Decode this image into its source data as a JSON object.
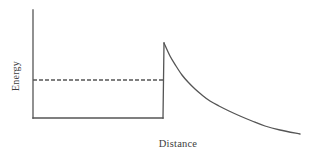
{
  "figure": {
    "background_color": "#ffffff",
    "stroke_color": "#555555",
    "text_color": "#3d3d3d"
  },
  "labels": {
    "ylabel": "Energy",
    "xlabel": "Distance"
  },
  "chart_data": {
    "type": "line",
    "title": "",
    "subtitle": "",
    "xlabel": "Distance",
    "ylabel": "Energy",
    "xlim": [
      0,
      312
    ],
    "ylim": [
      162,
      0
    ],
    "grid": false,
    "legend": null,
    "annotations": [],
    "series": [
      {
        "name": "y-axis",
        "role": "axis",
        "style": "solid",
        "x": [
          33,
          33
        ],
        "y": [
          10,
          118
        ]
      },
      {
        "name": "well-floor",
        "role": "potential",
        "style": "solid",
        "x": [
          33,
          163
        ],
        "y": [
          118,
          118
        ]
      },
      {
        "name": "barrier-wall",
        "role": "potential",
        "style": "solid",
        "x": [
          163,
          164
        ],
        "y": [
          118,
          43
        ]
      },
      {
        "name": "coulomb-decay",
        "role": "potential",
        "style": "solid",
        "x": [
          164,
          170,
          176,
          182,
          188,
          195,
          202,
          210,
          219,
          229,
          240,
          252,
          265,
          280,
          300
        ],
        "y": [
          43,
          56,
          66,
          75,
          82,
          89,
          95,
          101,
          106,
          111,
          116,
          121,
          126,
          130,
          134
        ]
      },
      {
        "name": "energy-level",
        "role": "reference",
        "style": "dashed",
        "dash_pattern": [
          4,
          2
        ],
        "x": [
          33,
          163
        ],
        "y": [
          80,
          80
        ]
      }
    ]
  }
}
